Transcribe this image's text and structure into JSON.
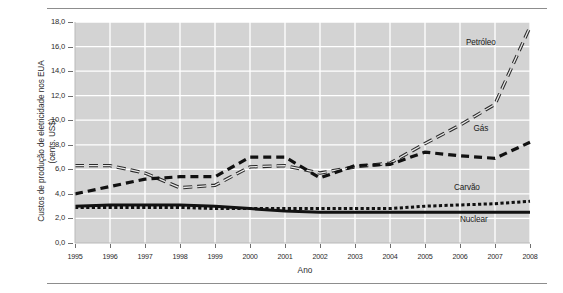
{
  "figure": {
    "ylabel_line1": "Custos de produção de eletricidade nos EUA",
    "ylabel_line2": "(cents. US$)",
    "xlabel": "Ano",
    "plot_bg": "#d3d3d3",
    "grid_color": "#ffffff",
    "axis_color": "#6f6f6f"
  },
  "chart_data": {
    "type": "line",
    "title": "",
    "subtitle": "",
    "xlabel": "Ano",
    "ylabel": "Custos de produção de eletricidade nos EUA (cents. US$)",
    "grid": true,
    "legend_position": "inline-annotations",
    "x": [
      1995,
      1996,
      1997,
      1998,
      1999,
      2000,
      2001,
      2002,
      2003,
      2004,
      2005,
      2006,
      2007,
      2008
    ],
    "xlim": [
      1995,
      2008
    ],
    "ylim": [
      0.0,
      18.0
    ],
    "ytick_labels": [
      "0,0",
      "2,0",
      "4,0",
      "6,0",
      "8,0",
      "10,0",
      "12,0",
      "14,0",
      "16,0",
      "18,0"
    ],
    "ytick_values": [
      0.0,
      2.0,
      4.0,
      6.0,
      8.0,
      10.0,
      12.0,
      14.0,
      16.0,
      18.0
    ],
    "xtick_labels": [
      "1995",
      "1996",
      "1997",
      "1998",
      "1999",
      "2000",
      "2001",
      "2002",
      "2003",
      "2004",
      "2005",
      "2006",
      "2007",
      "2008"
    ],
    "series": [
      {
        "name": "Petróleo",
        "style": "double-dashed-line",
        "label": "Petróleo",
        "values": [
          6.3,
          6.3,
          5.7,
          4.5,
          4.7,
          6.2,
          6.3,
          5.7,
          6.2,
          6.5,
          8.1,
          9.6,
          11.3,
          17.6
        ]
      },
      {
        "name": "Gás",
        "style": "thick-dashed",
        "label": "Gás",
        "values": [
          4.0,
          4.6,
          5.2,
          5.4,
          5.4,
          7.0,
          7.0,
          5.3,
          6.3,
          6.4,
          7.4,
          7.1,
          6.9,
          8.2
        ]
      },
      {
        "name": "Carvão",
        "style": "dotted",
        "label": "Carvão",
        "values": [
          2.9,
          2.9,
          2.9,
          2.9,
          2.8,
          2.8,
          2.8,
          2.8,
          2.8,
          2.8,
          3.0,
          3.1,
          3.2,
          3.4
        ]
      },
      {
        "name": "Nuclear",
        "style": "thick-solid",
        "label": "Nuclear",
        "values": [
          3.0,
          3.1,
          3.1,
          3.1,
          3.0,
          2.8,
          2.6,
          2.5,
          2.5,
          2.5,
          2.5,
          2.5,
          2.5,
          2.5
        ]
      }
    ],
    "annotations": [
      {
        "text": "Petróleo",
        "x": 2006.6,
        "y": 16.3
      },
      {
        "text": "Gás",
        "x": 2006.6,
        "y": 9.3
      },
      {
        "text": "Carvão",
        "x": 2006.2,
        "y": 4.5
      },
      {
        "text": "Nuclear",
        "x": 2006.4,
        "y": 1.9
      }
    ]
  }
}
